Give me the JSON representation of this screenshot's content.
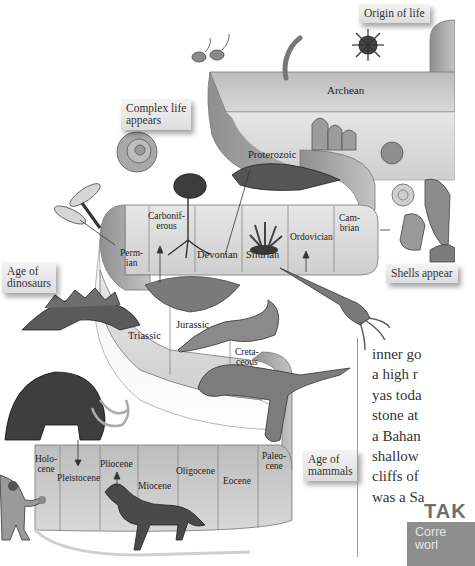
{
  "figure": {
    "type": "geologic-time-spiral",
    "callouts": {
      "origin_of_life": "Origin of life",
      "complex_life": "Complex life appears",
      "complex_life_line1": "Complex life",
      "complex_life_line2": "appears",
      "shells_appear": "Shells appear",
      "age_of_dinosaurs_line1": "Age of",
      "age_of_dinosaurs_line2": "dinosaurs",
      "age_of_mammals_line1": "Age of",
      "age_of_mammals_line2": "mammals"
    },
    "eons": {
      "archean": "Archean",
      "proterozoic": "Proterozoic"
    },
    "paleozoic_periods": {
      "cambrian_1": "Cam-",
      "cambrian_2": "brian",
      "ordovician": "Ordovician",
      "silurian": "Silurian",
      "devonian": "Devonian",
      "carboniferous_1": "Carbonif-",
      "carboniferous_2": "erous",
      "permian_1": "Perm-",
      "permian_2": "ian"
    },
    "mesozoic_periods": {
      "triassic": "Triassic",
      "jurassic": "Jurassic",
      "cretaceous_1": "Creta-",
      "cretaceous_2": "ceous"
    },
    "cenozoic_epochs": {
      "paleocene_1": "Paleo-",
      "paleocene_2": "cene",
      "eocene": "Eocene",
      "oligocene": "Oligocene",
      "miocene": "Miocene",
      "pliocene": "Pliocene",
      "pleistocene": "Pleistocene",
      "holocene_1": "Holo-",
      "holocene_2": "cene"
    }
  },
  "body_text": {
    "lines": [
      "inner go",
      "a high r",
      "yas toda",
      "stone at",
      "a Bahan",
      "shallow",
      "cliffs of",
      "was a Sa"
    ]
  },
  "takeaway": {
    "heading": "TAK",
    "box_line1": "Corre",
    "box_line2": "worl"
  }
}
